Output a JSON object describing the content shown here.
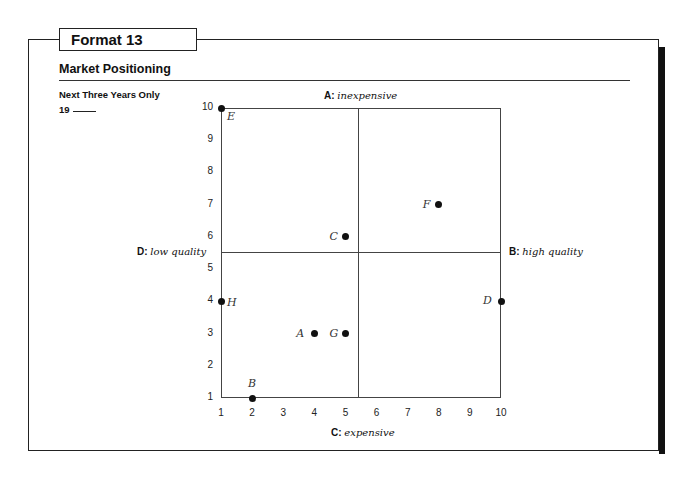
{
  "header": {
    "format_title": "Format 13",
    "section_title": "Market Positioning",
    "note": "Next Three Years Only",
    "year_prefix": "19"
  },
  "axes": {
    "top": {
      "key": "A:",
      "value": "inexpensive"
    },
    "right": {
      "key": "B:",
      "value": "high quality"
    },
    "bottom": {
      "key": "C:",
      "value": "expensive"
    },
    "left": {
      "key": "D:",
      "value": "low quality"
    }
  },
  "chart_data": {
    "type": "scatter",
    "title": "Market Positioning",
    "subtitle": "Next Three Years Only",
    "xlabel": "C: expensive (bottom) / A: inexpensive (top)",
    "ylabel": "D: low quality (left) / B: high quality (right)",
    "x_ticks": [
      "1",
      "2",
      "3",
      "4",
      "5",
      "6",
      "7",
      "8",
      "9",
      "10"
    ],
    "y_ticks": [
      "1",
      "2",
      "3",
      "4",
      "5",
      "6",
      "7",
      "8",
      "9",
      "10"
    ],
    "xlim": [
      1,
      10
    ],
    "ylim": [
      1,
      10
    ],
    "quadrant_dividers": {
      "x": 5.5,
      "y": 5.5
    },
    "grid": false,
    "points": [
      {
        "label": "A",
        "x": 4,
        "y": 3
      },
      {
        "label": "B",
        "x": 2,
        "y": 1
      },
      {
        "label": "C",
        "x": 5,
        "y": 6
      },
      {
        "label": "D",
        "x": 10,
        "y": 4
      },
      {
        "label": "E",
        "x": 1,
        "y": 10
      },
      {
        "label": "F",
        "x": 8,
        "y": 7
      },
      {
        "label": "G",
        "x": 5,
        "y": 3
      },
      {
        "label": "H",
        "x": 1,
        "y": 4
      }
    ]
  }
}
